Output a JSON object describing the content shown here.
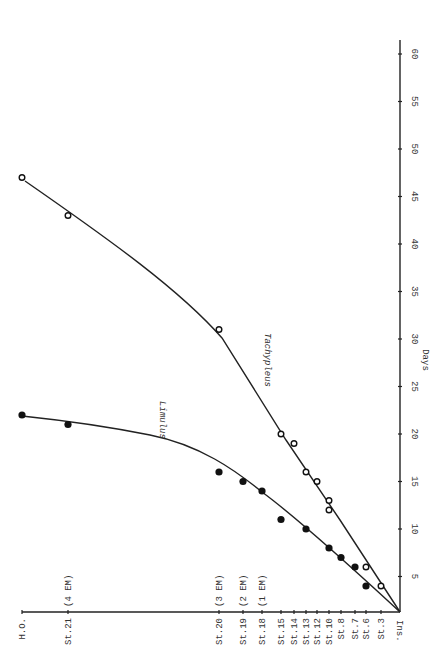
{
  "chart_data": {
    "type": "line",
    "orientation": "rotated-90",
    "xlabel": "Days",
    "ylabel": "Developmental stage",
    "x_ticks": [
      5,
      10,
      15,
      20,
      25,
      30,
      35,
      40,
      45,
      50,
      55,
      60
    ],
    "x_range": [
      0,
      62
    ],
    "y_categories": [
      {
        "label": "Ins.",
        "pos": 400
      },
      {
        "label": "St.3",
        "pos": 381
      },
      {
        "label": "St.6",
        "pos": 366
      },
      {
        "label": "St.7",
        "pos": 355
      },
      {
        "label": "St.8",
        "pos": 341
      },
      {
        "label": "St.10",
        "pos": 329
      },
      {
        "label": "St.12",
        "pos": 317
      },
      {
        "label": "St.13",
        "pos": 306
      },
      {
        "label": "St.14",
        "pos": 294
      },
      {
        "label": "St.15",
        "pos": 281
      },
      {
        "label": "St.18",
        "pos": 262,
        "note": "(1 EM)"
      },
      {
        "label": "St.19",
        "pos": 243,
        "note": "(2 EM)"
      },
      {
        "label": "St.20",
        "pos": 219,
        "note": "(3 EM)"
      },
      {
        "label": "St.21",
        "pos": 68,
        "note": "(4 EM)"
      },
      {
        "label": "H.O.",
        "pos": 22
      }
    ],
    "series": [
      {
        "name": "Limulus",
        "marker": "filled-circle",
        "points": [
          {
            "stage": "St.6",
            "day": 4
          },
          {
            "stage": "St.7",
            "day": 6
          },
          {
            "stage": "St.8",
            "day": 7
          },
          {
            "stage": "St.10",
            "day": 8
          },
          {
            "stage": "St.13",
            "day": 10
          },
          {
            "stage": "St.15",
            "day": 11
          },
          {
            "stage": "St.18",
            "day": 14
          },
          {
            "stage": "St.19",
            "day": 15
          },
          {
            "stage": "St.20",
            "day": 16
          },
          {
            "stage": "St.21",
            "day": 21
          },
          {
            "stage": "H.O.",
            "day": 22
          }
        ]
      },
      {
        "name": "Tachypleus",
        "marker": "open-circle",
        "points": [
          {
            "stage": "St.3",
            "day": 4
          },
          {
            "stage": "St.6",
            "day": 6
          },
          {
            "stage": "St.10",
            "day": 12
          },
          {
            "stage": "St.10",
            "day": 13
          },
          {
            "stage": "St.12",
            "day": 15
          },
          {
            "stage": "St.13",
            "day": 16
          },
          {
            "stage": "St.14",
            "day": 19
          },
          {
            "stage": "St.15",
            "day": 20
          },
          {
            "stage": "St.20",
            "day": 31
          },
          {
            "stage": "St.21",
            "day": 43
          },
          {
            "stage": "H.O.",
            "day": 47
          }
        ]
      }
    ],
    "grid": false,
    "legend": "inline labels"
  },
  "labels": {
    "xlabel": "Days",
    "limulus": "Limulus",
    "tachypleus": "Tachypleus",
    "origin": "Ins."
  }
}
